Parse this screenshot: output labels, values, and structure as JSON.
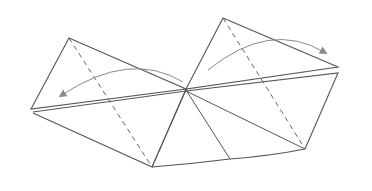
{
  "diagram": {
    "type": "origami-fold-instruction",
    "width": 372,
    "height": 191,
    "colors": {
      "background": "#ffffff",
      "line": "#555555",
      "arrow": "#8a8a8a",
      "dash": "#666666"
    },
    "left_flap": {
      "points": "69,38 186,89 31,109",
      "lower_points": "33,113 152,167 186,89",
      "fold_line": {
        "x1": 69,
        "y1": 38,
        "x2": 152,
        "y2": 167
      },
      "arrow": {
        "path": "M183,82 Q130,50 62,95",
        "direction": "left"
      }
    },
    "right_flap": {
      "points": "223,18 338,67 186,89",
      "lower_points": "186,91 338,73 305,149",
      "fold_line": {
        "x1": 223,
        "y1": 18,
        "x2": 305,
        "y2": 149
      },
      "arrow": {
        "path": "M208,70 Q270,20 324,52",
        "direction": "right"
      }
    },
    "center_point": {
      "x": 186,
      "y": 89
    },
    "bottom": {
      "points": "152,167 230,159 305,149",
      "inner_lines": [
        {
          "x1": 186,
          "y1": 90,
          "x2": 152,
          "y2": 167
        },
        {
          "x1": 186,
          "y1": 90,
          "x2": 230,
          "y2": 159
        }
      ]
    }
  }
}
